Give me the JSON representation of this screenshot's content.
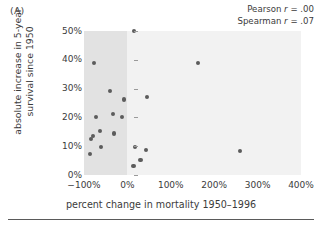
{
  "figure": {
    "panel_letter": "(A)"
  },
  "annotation": {
    "pearson_prefix": "Pearson ",
    "pearson_r": "r",
    "pearson_value": " = .00",
    "spearman_prefix": "Spearman ",
    "spearman_r": "r",
    "spearman_value": " = .07"
  },
  "chart_data": {
    "type": "scatter",
    "title": "",
    "panel": "(A)",
    "xlabel": "percent change in mortality 1950–1996",
    "ylabel": "absolute increase in 5-year survival since 1950",
    "ylabel_line1": "absolute increase in 5-year",
    "ylabel_line2": "survival since 1950",
    "xlim": [
      -100,
      400
    ],
    "ylim": [
      0,
      50
    ],
    "xticks": [
      -100,
      0,
      100,
      200,
      300,
      400
    ],
    "xticklabels": [
      "−100%",
      "0%",
      "100%",
      "200%",
      "300%",
      "400%"
    ],
    "yticks": [
      0,
      10,
      20,
      30,
      40,
      50
    ],
    "yticklabels": [
      "0%",
      "10%",
      "20%",
      "30%",
      "40%",
      "50%"
    ],
    "grid": false,
    "legend": "none",
    "shaded_region": {
      "x_from": -100,
      "x_to": 0,
      "color": "#e2e2e2",
      "description": "darker band marking negative percent change in mortality"
    },
    "plot_background": "#f2f2f2",
    "point_color": "#5c5c5c",
    "annotations": [
      "Pearson r = .00",
      "Spearman r = .07"
    ],
    "statistics": {
      "pearson_r": 0.0,
      "spearman_r": 0.07
    },
    "points": [
      {
        "x": -77,
        "y": 39.0
      },
      {
        "x": -86,
        "y": 7.3
      },
      {
        "x": -84,
        "y": 12.5
      },
      {
        "x": -80,
        "y": 13.5
      },
      {
        "x": -72,
        "y": 20.2
      },
      {
        "x": -63,
        "y": 15.3
      },
      {
        "x": -60,
        "y": 9.6
      },
      {
        "x": -40,
        "y": 29.3
      },
      {
        "x": -33,
        "y": 21.3
      },
      {
        "x": -30,
        "y": 14.4
      },
      {
        "x": -12,
        "y": 20.0
      },
      {
        "x": -8,
        "y": 26.2
      },
      {
        "x": 16,
        "y": 50.0
      },
      {
        "x": 14,
        "y": 3.0
      },
      {
        "x": 18,
        "y": 9.7
      },
      {
        "x": 30,
        "y": 5.3
      },
      {
        "x": 42,
        "y": 8.8
      },
      {
        "x": 46,
        "y": 27.1
      },
      {
        "x": 163,
        "y": 39.0
      },
      {
        "x": 260,
        "y": 8.4
      }
    ]
  }
}
